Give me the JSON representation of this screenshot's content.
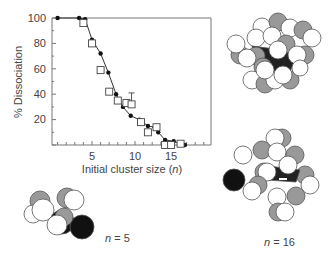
{
  "chart_data": {
    "type": "scatter",
    "title": "",
    "xlabel": "Initial cluster size (n)",
    "ylabel": "% Dissociation",
    "xlim": [
      0.5,
      19
    ],
    "ylim": [
      0,
      100
    ],
    "x_ticks": [
      5,
      10,
      15
    ],
    "y_ticks": [
      20,
      40,
      60,
      80,
      100
    ],
    "grid": false,
    "series": [
      {
        "name": "simulation",
        "marker": "filled-circle",
        "line": true,
        "x": [
          1,
          3.5,
          4.2,
          5,
          6,
          6.9,
          7.8,
          8.6,
          9.5,
          10.5,
          11.5,
          12.3,
          12.7,
          13.5,
          14.5,
          15.2,
          15.8
        ],
        "y": [
          100,
          100,
          99,
          83,
          72,
          57,
          40,
          30,
          23,
          20,
          15,
          14,
          10,
          4,
          3,
          1,
          0
        ]
      },
      {
        "name": "experiment",
        "marker": "open-square",
        "line": false,
        "x": [
          4,
          5,
          6,
          7,
          8,
          9,
          9.6,
          10.7,
          11.5,
          12.5,
          13.5,
          14.2,
          15.3
        ],
        "y": [
          96,
          80,
          59,
          42,
          35,
          33,
          32,
          18,
          10,
          14,
          0,
          0,
          1
        ],
        "error_bars": [
          {
            "x": 9.6,
            "low": 32,
            "high": 41
          }
        ]
      }
    ],
    "reference_line": {
      "y": 100,
      "from_x": 1,
      "to_x": 19
    }
  },
  "labels": {
    "ylabel": "% Dissociation",
    "xlabel_prefix": "Initial cluster size (",
    "xlabel_var": "n",
    "xlabel_suffix": ")",
    "tick_5": "5",
    "tick_10": "10",
    "tick_15": "15",
    "tick_20": "20",
    "tick_40": "40",
    "tick_60": "60",
    "tick_80": "80",
    "tick_100": "100"
  },
  "clusters": {
    "small": {
      "var": "n",
      "eq": " = 5"
    },
    "large": {
      "var": "n",
      "eq": " = 16"
    }
  }
}
